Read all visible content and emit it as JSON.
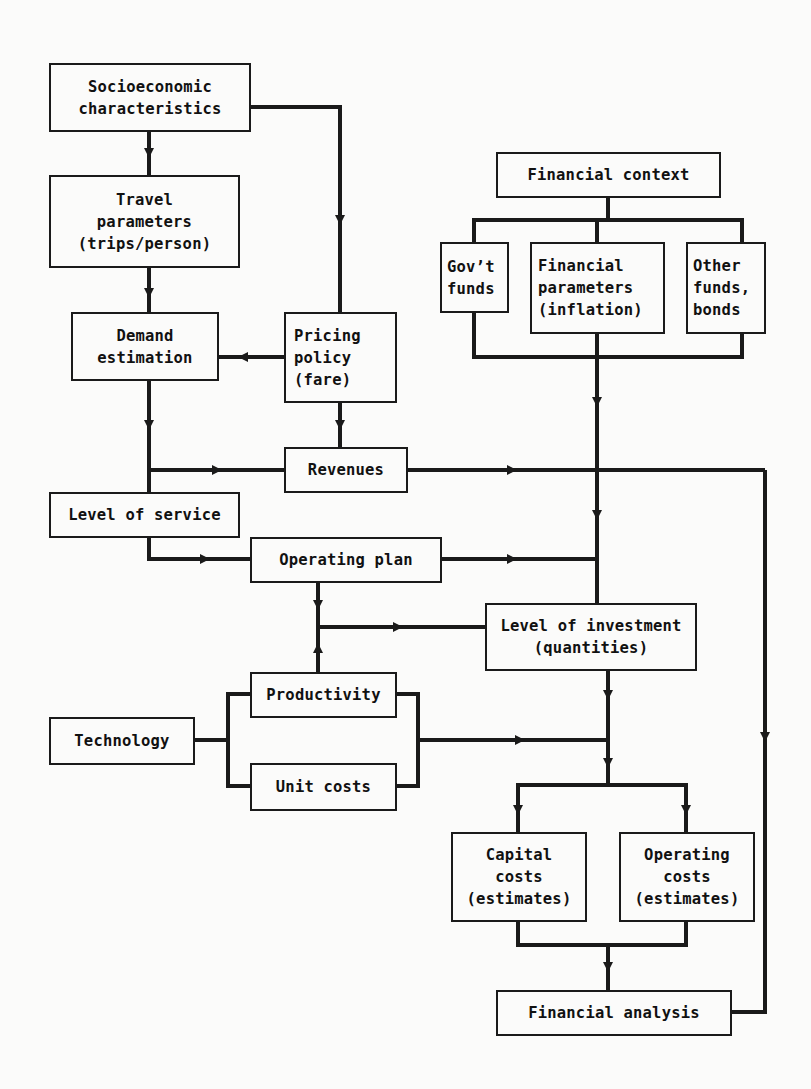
{
  "diagram": {
    "type": "flowchart",
    "nodes": {
      "socio": "Socioeconomic\ncharacteristics",
      "travel": "Travel\nparameters\n(trips/person)",
      "demand": "Demand\nestimation",
      "pricing": "Pricing\npolicy\n(fare)",
      "revenues": "Revenues",
      "los": "Level of service",
      "opplan": "Operating plan",
      "investment": "Level of investment\n(quantities)",
      "productivity": "Productivity",
      "technology": "Technology",
      "unitcosts": "Unit costs",
      "capital": "Capital\ncosts\n(estimates)",
      "opcosts": "Operating\ncosts\n(estimates)",
      "finanalysis": "Financial analysis",
      "fincontext": "Financial context",
      "govt": "Gov’t\nfunds",
      "finparams": "Financial\nparameters\n(inflation)",
      "otherfunds": "Other\nfunds,\nbonds"
    },
    "edges": [
      {
        "from": "Socioeconomic characteristics",
        "to": "Travel parameters"
      },
      {
        "from": "Socioeconomic characteristics",
        "to": "Pricing policy"
      },
      {
        "from": "Travel parameters",
        "to": "Demand estimation"
      },
      {
        "from": "Pricing policy",
        "to": "Demand estimation"
      },
      {
        "from": "Pricing policy",
        "to": "Revenues"
      },
      {
        "from": "Demand estimation",
        "to": "Level of service"
      },
      {
        "from": "Demand estimation",
        "to": "Revenues"
      },
      {
        "from": "Level of service",
        "to": "Operating plan"
      },
      {
        "from": "Revenues",
        "to": "Level of investment"
      },
      {
        "from": "Revenues",
        "to": "Financial analysis"
      },
      {
        "from": "Financial context",
        "to": "Gov't funds / Financial parameters / Other funds"
      },
      {
        "from": "Financial parameters group",
        "to": "Level of investment"
      },
      {
        "from": "Operating plan",
        "to": "Level of investment"
      },
      {
        "from": "Operating plan",
        "to": "Level of investment (via junction)"
      },
      {
        "from": "Productivity",
        "to": "Level of investment (via junction)"
      },
      {
        "from": "Technology",
        "to": "Productivity / Unit costs"
      },
      {
        "from": "Productivity / Unit costs",
        "to": "Capital costs / Operating costs"
      },
      {
        "from": "Level of investment",
        "to": "Capital costs"
      },
      {
        "from": "Level of investment",
        "to": "Operating costs"
      },
      {
        "from": "Capital costs / Operating costs",
        "to": "Financial analysis"
      }
    ]
  },
  "colors": {
    "line": "#1a1a1a",
    "background": "#fbfbfa"
  }
}
